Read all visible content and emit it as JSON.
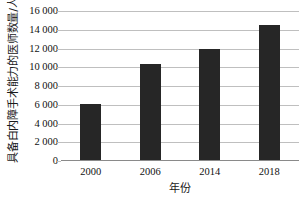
{
  "chart_data": {
    "type": "bar",
    "title": "",
    "xlabel": "年份",
    "ylabel": "具备白内障手术能力的医师数量/人",
    "categories": [
      "2000",
      "2006",
      "2014",
      "2018"
    ],
    "values": [
      6000,
      10200,
      11800,
      14400
    ],
    "series": [
      {
        "name": "具备白内障手术能力的医师数量",
        "values": [
          6000,
          10200,
          11800,
          14400
        ]
      }
    ],
    "ylim": [
      0,
      16000
    ],
    "ytick_values": [
      0,
      2000,
      4000,
      6000,
      8000,
      10000,
      12000,
      14000,
      16000
    ],
    "ytick_labels": [
      "0",
      "2 000",
      "4 000",
      "6 000",
      "8 000",
      "10 000",
      "12 000",
      "14 000",
      "16 000"
    ],
    "grid": true,
    "grid_axis": "y",
    "legend": false,
    "legend_position": "none",
    "bar_color": "#262626",
    "grid_color": "#bfbfbf",
    "axis_color": "#8a8a8a",
    "text_color": "#111111",
    "background": "#ffffff"
  }
}
